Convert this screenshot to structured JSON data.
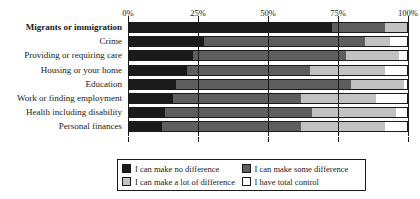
{
  "chart_data": {
    "type": "bar",
    "subtype": "stacked-horizontal-100pct",
    "title": "",
    "subtitle": "",
    "xlabel": "",
    "ylabel": "",
    "xlim": [
      0,
      100
    ],
    "xticks": [
      "0%",
      "25%",
      "50%",
      "75%",
      "100%"
    ],
    "xtick_values": [
      0,
      25,
      50,
      75,
      100
    ],
    "grid": true,
    "legend_position": "bottom",
    "categories": [
      "Migrants or immigration",
      "Crime",
      "Providing or requiring care",
      "Housing or your home",
      "Education",
      "Work or finding employment",
      "Health including disability",
      "Personal finances"
    ],
    "emphasized_category": "Migrants or immigration",
    "series": [
      {
        "name": "I can make no difference",
        "color": "#1a1a1a",
        "values": [
          73,
          27,
          23,
          21,
          17,
          16,
          13,
          12
        ]
      },
      {
        "name": "I can make some difference",
        "color": "#5e5e5e",
        "values": [
          19,
          58,
          55,
          44,
          63,
          46,
          53,
          50
        ]
      },
      {
        "name": "I can make a lot of difference",
        "color": "#c2c2c2",
        "values": [
          8,
          9,
          19,
          27,
          19,
          27,
          30,
          30
        ]
      },
      {
        "name": "I have total control",
        "color": "#ffffff",
        "values": [
          0,
          6,
          3,
          8,
          1,
          11,
          4,
          8
        ]
      }
    ]
  },
  "legend": {
    "items": [
      {
        "label": "I can make no difference",
        "color": "#1a1a1a"
      },
      {
        "label": "I can make some difference",
        "color": "#5e5e5e"
      },
      {
        "label": "I can make a lot of difference",
        "color": "#c2c2c2"
      },
      {
        "label": "I have total control",
        "color": "#ffffff"
      }
    ]
  }
}
